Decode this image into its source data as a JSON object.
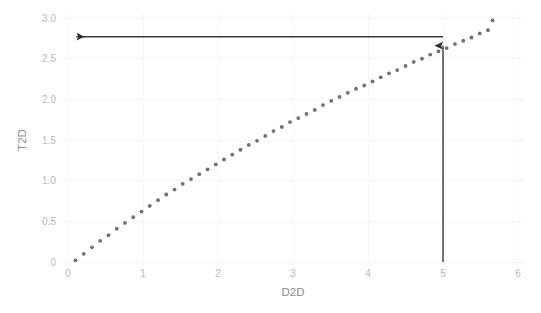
{
  "chart_data": {
    "type": "scatter",
    "title": "",
    "subtitle": "",
    "xlabel": "D2D",
    "ylabel": "T2D",
    "xlim": [
      0,
      6
    ],
    "ylim": [
      0,
      3.0
    ],
    "xticks": [
      0,
      1,
      2,
      3,
      4,
      5,
      6
    ],
    "xtick_labels": [
      "0",
      "1",
      "2",
      "3",
      "4",
      "5",
      "6"
    ],
    "yticks": [
      0,
      0.5,
      1.0,
      1.5,
      2.0,
      2.5,
      3.0
    ],
    "ytick_labels": [
      "0",
      "0.5",
      "1.0",
      "1.5",
      "2.0",
      "2.5",
      "3.0"
    ],
    "grid": true,
    "legend": null,
    "marker": "dotted-curve",
    "marker_color": "#6f6f74",
    "series": [
      {
        "name": "T2D",
        "x": [
          0.1,
          0.21,
          0.32,
          0.43,
          0.54,
          0.65,
          0.76,
          0.87,
          0.98,
          1.09,
          1.2,
          1.31,
          1.42,
          1.53,
          1.64,
          1.75,
          1.86,
          1.97,
          2.08,
          2.19,
          2.3,
          2.41,
          2.52,
          2.63,
          2.74,
          2.85,
          2.96,
          3.07,
          3.18,
          3.29,
          3.4,
          3.51,
          3.62,
          3.73,
          3.84,
          3.95,
          4.06,
          4.17,
          4.28,
          4.39,
          4.5,
          4.61,
          4.72,
          4.83,
          4.94,
          5.05,
          5.16,
          5.27,
          5.38,
          5.49,
          5.6,
          5.66
        ],
        "y": [
          0.02,
          0.1,
          0.18,
          0.26,
          0.33,
          0.41,
          0.48,
          0.55,
          0.62,
          0.69,
          0.76,
          0.83,
          0.89,
          0.96,
          1.02,
          1.08,
          1.14,
          1.2,
          1.26,
          1.32,
          1.38,
          1.44,
          1.49,
          1.55,
          1.61,
          1.66,
          1.72,
          1.77,
          1.82,
          1.87,
          1.93,
          1.98,
          2.03,
          2.08,
          2.13,
          2.17,
          2.22,
          2.27,
          2.32,
          2.36,
          2.41,
          2.46,
          2.5,
          2.55,
          2.59,
          2.63,
          2.68,
          2.72,
          2.76,
          2.81,
          2.85,
          2.97
        ]
      }
    ],
    "annotations": [
      {
        "name": "vertical-lookup-arrow",
        "kind": "arrow",
        "from_x": 5.0,
        "from_y": 0.0,
        "to_x": 5.0,
        "to_y": 2.77,
        "direction": "up",
        "color": "#2e2e2e"
      },
      {
        "name": "horizontal-lookup-arrow",
        "kind": "arrow",
        "from_x": 5.0,
        "from_y": 2.77,
        "to_x": 0.1,
        "to_y": 2.77,
        "direction": "left",
        "color": "#2e2e2e"
      }
    ],
    "readout": {
      "x_value": "5",
      "y_value": "2.77"
    }
  },
  "axes": {
    "x_title": "D2D",
    "y_title": "T2D"
  }
}
